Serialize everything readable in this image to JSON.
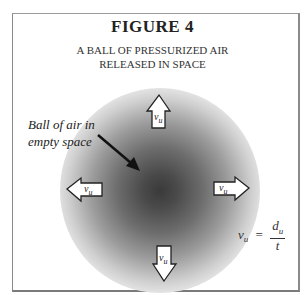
{
  "figure": {
    "title": "FIGURE  4",
    "subtitle_line1": "A BALL OF PRESSURIZED AIR",
    "subtitle_line2": "RELEASED IN SPACE"
  },
  "annotation": {
    "line1": "Ball of air in",
    "line2": "empty space"
  },
  "arrows": {
    "up": {
      "label": "v",
      "subscript": "u"
    },
    "left": {
      "label": "v",
      "subscript": "u"
    },
    "right": {
      "label": "v",
      "subscript": "u"
    },
    "down": {
      "label": "v",
      "subscript": "u"
    }
  },
  "formula": {
    "lhs": "v",
    "lhs_sub": "u",
    "equals": "=",
    "numerator": "d",
    "numerator_sub": "u",
    "denominator": "t"
  },
  "colors": {
    "border": "#8a8a8a",
    "ball_center": "#3a3a3a",
    "text": "#222222"
  }
}
